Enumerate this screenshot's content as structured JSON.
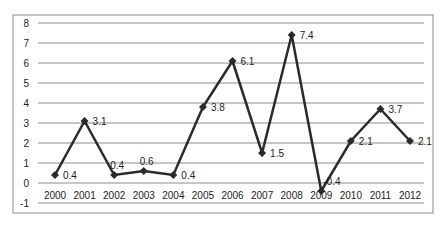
{
  "chart_data": {
    "type": "line",
    "title": "",
    "xlabel": "",
    "ylabel": "",
    "categories": [
      "2000",
      "2001",
      "2002",
      "2003",
      "2004",
      "2005",
      "2006",
      "2007",
      "2008",
      "2009",
      "2010",
      "2011",
      "2012"
    ],
    "series": [
      {
        "name": "",
        "values": [
          0.4,
          3.1,
          0.4,
          0.6,
          0.4,
          3.8,
          6.1,
          1.5,
          7.4,
          -0.4,
          2.1,
          3.7,
          2.1
        ],
        "labels": [
          "0.4",
          "3.1",
          "0.4",
          "0.6",
          "0.4",
          "3.8",
          "6.1",
          "1.5",
          "7.4",
          "-0.4",
          "2.1",
          "3.7",
          "2.1"
        ],
        "color": "#2a2a2a",
        "marker": "diamond"
      }
    ],
    "yticks": [
      -1,
      0,
      1,
      2,
      3,
      4,
      5,
      6,
      7,
      8
    ],
    "ylim": [
      -1,
      8
    ],
    "grid": true,
    "legend": "none"
  }
}
